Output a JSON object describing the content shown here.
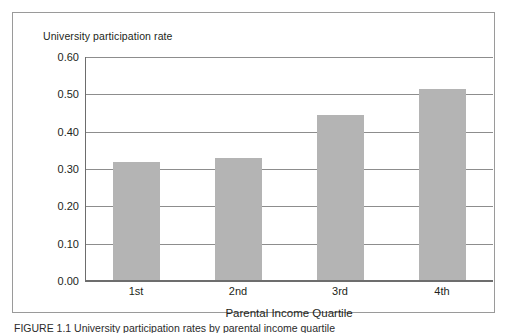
{
  "figure": {
    "caption": "FIGURE 1.1  University participation rates by parental income quartile",
    "frame_color": "#9a9a9a",
    "background": "#ffffff"
  },
  "chart_data": {
    "type": "bar",
    "title": "University participation rate",
    "xlabel": "Parental Income Quartile",
    "ylabel": "",
    "categories": [
      "1st",
      "2nd",
      "3rd",
      "4th"
    ],
    "values": [
      0.32,
      0.33,
      0.445,
      0.515
    ],
    "ylim": [
      0.0,
      0.6
    ],
    "ytick_labels": [
      "0.60",
      "0.50",
      "0.40",
      "0.30",
      "0.20",
      "0.10",
      "0.00"
    ],
    "ytick_values": [
      0.6,
      0.5,
      0.4,
      0.3,
      0.2,
      0.1,
      0.0
    ],
    "grid": true,
    "legend": false,
    "bar_color": "#b4b4b4",
    "axis_color": "#6d6d6d",
    "gridline_color": "#8d8d8d"
  }
}
